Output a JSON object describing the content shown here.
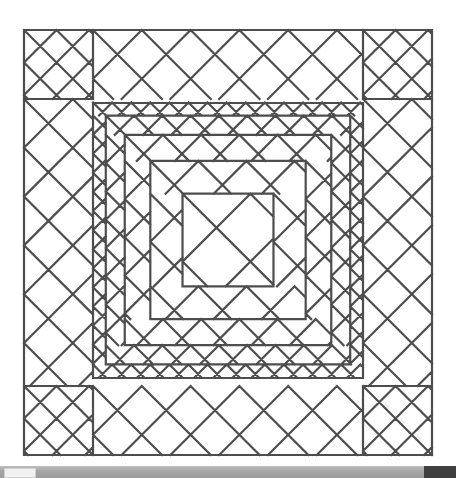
{
  "document": {
    "title": "Quilt Block Diagram",
    "kind": "line-drawing"
  },
  "figure": {
    "name": "trip-around-the-world-quilt-block",
    "line_color": "#4d4d4d",
    "background_color": "#ffffff",
    "line_width": 2.2
  },
  "geometry": {
    "outer_square": {
      "x": 24,
      "y": 30,
      "width": 408,
      "height": 425
    },
    "inner_square": {
      "x": 93,
      "y": 103,
      "width": 270,
      "height": 275
    },
    "border_band_width": 69,
    "corner_cell_size": 23,
    "border_diamond_half": 34.5,
    "inner_rings": 5,
    "inner_cell_sizes": [
      13.5,
      20,
      27,
      34,
      48
    ],
    "center": {
      "x": 228,
      "y": 240
    }
  },
  "scrollbar": {
    "name": "horizontal-scrollbar",
    "track_color": "#a8a8a8",
    "thumb_color": "#f1f1f1",
    "corner_color": "#3f3f3f",
    "thumb_position_percent": 1,
    "thumb_width_percent": 7
  }
}
